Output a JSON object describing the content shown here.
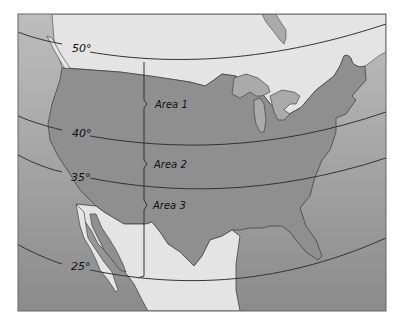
{
  "map": {
    "latitude_labels": [
      {
        "id": "lat-50",
        "label": "50°"
      },
      {
        "id": "lat-40",
        "label": "40°"
      },
      {
        "id": "lat-35",
        "label": "35°"
      },
      {
        "id": "lat-25",
        "label": "25°"
      }
    ],
    "area_labels": [
      {
        "id": "area-1",
        "label": "Area 1"
      },
      {
        "id": "area-2",
        "label": "Area 2"
      },
      {
        "id": "area-3",
        "label": "Area 3"
      }
    ],
    "colors": {
      "ocean_top": "#b9b9b9",
      "ocean_bottom": "#8d8d8d",
      "usa": "#8f8f8f",
      "canada_mexico": "#e6e6e6",
      "lakes": "#a9a9a9",
      "lines": "#333333"
    }
  }
}
